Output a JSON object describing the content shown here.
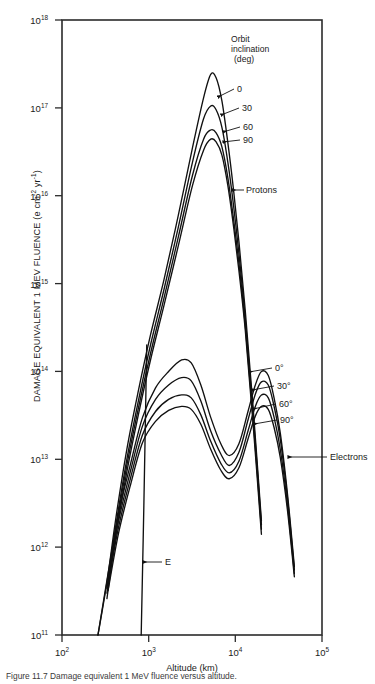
{
  "figure": {
    "caption": "Figure 11.7  Damage equivalent 1 MeV fluence versus altitude."
  },
  "axes": {
    "x": {
      "title": "Altitude (km)",
      "ticks": [
        {
          "mantissa": "10",
          "exp": "2",
          "value": 100
        },
        {
          "mantissa": "10",
          "exp": "3",
          "value": 1000
        },
        {
          "mantissa": "10",
          "exp": "4",
          "value": 10000
        },
        {
          "mantissa": "10",
          "exp": "5",
          "value": 100000
        }
      ]
    },
    "y": {
      "title_main": "DAMAGE EQUIVALENT 1 MEV FLUENCE (e cm",
      "title_sup1": "-2",
      "title_mid": " yr",
      "title_sup2": "-1",
      "title_end": ")",
      "ticks": [
        {
          "mantissa": "10",
          "exp": "18",
          "value": 1e+18
        },
        {
          "mantissa": "10",
          "exp": "17",
          "value": 1e+17
        },
        {
          "mantissa": "10",
          "exp": "16",
          "value": 1e+16
        },
        {
          "mantissa": "10",
          "exp": "15",
          "value": 1000000000000000.0
        },
        {
          "mantissa": "10",
          "exp": "14",
          "value": 100000000000000.0
        },
        {
          "mantissa": "10",
          "exp": "13",
          "value": 10000000000000.0
        },
        {
          "mantissa": "10",
          "exp": "12",
          "value": 1000000000000.0
        },
        {
          "mantissa": "10",
          "exp": "11",
          "value": 100000000000.0
        }
      ]
    }
  },
  "legend": {
    "line1": "Orbit",
    "line2": "inclination",
    "line3": "(deg)"
  },
  "annotations": {
    "protons": "Protons",
    "electrons": "Electrons",
    "e_marker": "E",
    "proton_labels": [
      "0",
      "30",
      "60",
      "90"
    ],
    "electron_labels": [
      "0°",
      "30°",
      "60°",
      "90°"
    ]
  },
  "chart_data": {
    "type": "line",
    "xlabel": "Altitude (km)",
    "ylabel": "DAMAGE EQUIVALENT 1 MEV FLUENCE (e cm^-2 yr^-1)",
    "xscale": "log",
    "yscale": "log",
    "xlim": [
      100,
      100000
    ],
    "ylim": [
      100000000000.0,
      1e+18
    ],
    "grid": false,
    "legend_position": "inside-upper-right",
    "legend_title": "Orbit inclination (deg)",
    "series": [
      {
        "name": "Protons 0 deg",
        "particle": "protons",
        "inclination_deg": 0,
        "x": [
          260,
          330,
          420,
          560,
          760,
          1050,
          1500,
          2200,
          3200,
          4300,
          5200,
          6000,
          7000,
          8200,
          9500,
          11000,
          13000,
          16000,
          20000
        ],
        "y": [
          100000000000.0,
          400000000000.0,
          2200000000000.0,
          13000000000000.0,
          60000000000000.0,
          260000000000000.0,
          1100000000000000.0,
          6000000000000000.0,
          3.5e+16,
          1.3e+17,
          2.4e+17,
          2.2e+17,
          1.2e+17,
          4e+16,
          1.2e+16,
          3000000000000000.0,
          500000000000000.0,
          40000000000000.0,
          2000000000000.0
        ]
      },
      {
        "name": "Protons 30 deg",
        "particle": "protons",
        "inclination_deg": 30,
        "x": [
          260,
          330,
          420,
          560,
          760,
          1050,
          1500,
          2200,
          3200,
          4300,
          5200,
          6000,
          7000,
          8200,
          9500,
          11000,
          13000,
          16000,
          20000
        ],
        "y": [
          90000000000.0,
          340000000000.0,
          1800000000000.0,
          10000000000000.0,
          46000000000000.0,
          200000000000000.0,
          850000000000000.0,
          4400000000000000.0,
          2.4e+16,
          7.5e+16,
          1.05e+17,
          9.5e+16,
          6e+16,
          2.4e+16,
          8000000000000000.0,
          2200000000000000.0,
          400000000000000.0,
          34000000000000.0,
          1800000000000.0
        ]
      },
      {
        "name": "Protons 60 deg",
        "particle": "protons",
        "inclination_deg": 60,
        "x": [
          260,
          330,
          420,
          560,
          760,
          1050,
          1500,
          2200,
          3200,
          4300,
          5200,
          6000,
          7000,
          8200,
          9500,
          11000,
          13000,
          16000,
          20000
        ],
        "y": [
          80000000000.0,
          300000000000.0,
          1600000000000.0,
          8500000000000.0,
          38000000000000.0,
          160000000000000.0,
          680000000000000.0,
          3400000000000000.0,
          1.7e+16,
          4.4e+16,
          5.6e+16,
          5.2e+16,
          3.6e+16,
          1.6e+16,
          5600000000000000.0,
          1700000000000000.0,
          340000000000000.0,
          30000000000000.0,
          1600000000000.0
        ]
      },
      {
        "name": "Protons 90 deg",
        "particle": "protons",
        "inclination_deg": 90,
        "x": [
          260,
          330,
          420,
          560,
          760,
          1050,
          1500,
          2200,
          3200,
          4300,
          5200,
          6000,
          7000,
          8200,
          9500,
          11000,
          13000,
          16000,
          20000
        ],
        "y": [
          70000000000.0,
          260000000000.0,
          1400000000000.0,
          7200000000000.0,
          32000000000000.0,
          135000000000000.0,
          560000000000000.0,
          2700000000000000.0,
          1.3e+16,
          3.3e+16,
          4.4e+16,
          4.1e+16,
          2.9e+16,
          1.3e+16,
          4600000000000000.0,
          1400000000000000.0,
          300000000000000.0,
          26000000000000.0,
          1400000000000.0
        ]
      },
      {
        "name": "Electrons 0 deg",
        "particle": "electrons",
        "inclination_deg": 0,
        "x": [
          260,
          340,
          450,
          620,
          850,
          1200,
          1700,
          2400,
          3100,
          4000,
          5200,
          6800,
          8500,
          11000,
          14000,
          17000,
          20000,
          24000,
          28000,
          33000,
          40000,
          48000
        ],
        "y": [
          100000000000.0,
          500000000000.0,
          2400000000000.0,
          9000000000000.0,
          30000000000000.0,
          65000000000000.0,
          100000000000000.0,
          135000000000000.0,
          125000000000000.0,
          70000000000000.0,
          30000000000000.0,
          15000000000000.0,
          11000000000000.0,
          15000000000000.0,
          35000000000000.0,
          70000000000000.0,
          100000000000000.0,
          90000000000000.0,
          50000000000000.0,
          20000000000000.0,
          4000000000000.0,
          600000000000.0
        ]
      },
      {
        "name": "Electrons 30 deg",
        "particle": "electrons",
        "inclination_deg": 30,
        "x": [
          260,
          340,
          450,
          620,
          850,
          1200,
          1700,
          2400,
          3100,
          4000,
          5200,
          6800,
          8500,
          11000,
          14000,
          17000,
          20000,
          24000,
          28000,
          33000,
          40000,
          48000
        ],
        "y": [
          90000000000.0,
          440000000000.0,
          2000000000000.0,
          7500000000000.0,
          24000000000000.0,
          48000000000000.0,
          70000000000000.0,
          85000000000000.0,
          78000000000000.0,
          46000000000000.0,
          21000000000000.0,
          11500000000000.0,
          8500000000000.0,
          12000000000000.0,
          28000000000000.0,
          55000000000000.0,
          76000000000000.0,
          70000000000000.0,
          40000000000000.0,
          17000000000000.0,
          3600000000000.0,
          550000000000.0
        ]
      },
      {
        "name": "Electrons 60 deg",
        "particle": "electrons",
        "inclination_deg": 60,
        "x": [
          260,
          340,
          450,
          620,
          850,
          1200,
          1700,
          2400,
          3100,
          4000,
          5200,
          6800,
          8500,
          11000,
          14000,
          17000,
          20000,
          24000,
          28000,
          33000,
          40000,
          48000
        ],
        "y": [
          80000000000.0,
          380000000000.0,
          1700000000000.0,
          6200000000000.0,
          19000000000000.0,
          35000000000000.0,
          48000000000000.0,
          54000000000000.0,
          50000000000000.0,
          32000000000000.0,
          16000000000000.0,
          9000000000000.0,
          7000000000000.0,
          9500000000000.0,
          21000000000000.0,
          40000000000000.0,
          54000000000000.0,
          50000000000000.0,
          30000000000000.0,
          13000000000000.0,
          3000000000000.0,
          500000000000.0
        ]
      },
      {
        "name": "Electrons 90 deg",
        "particle": "electrons",
        "inclination_deg": 90,
        "x": [
          260,
          340,
          450,
          620,
          850,
          1200,
          1700,
          2400,
          3100,
          4000,
          5200,
          6800,
          8500,
          11000,
          14000,
          17000,
          20000,
          24000,
          28000,
          33000,
          40000,
          48000
        ],
        "y": [
          70000000000.0,
          320000000000.0,
          1450000000000.0,
          5200000000000.0,
          15500000000000.0,
          27000000000000.0,
          36000000000000.0,
          40000000000000.0,
          37000000000000.0,
          25000000000000.0,
          13000000000000.0,
          7500000000000.0,
          6000000000000.0,
          8000000000000.0,
          17000000000000.0,
          31000000000000.0,
          40000000000000.0,
          37000000000000.0,
          23000000000000.0,
          10500000000000.0,
          2600000000000.0,
          460000000000.0
        ]
      },
      {
        "name": "E boundary marker",
        "particle": "marker",
        "x": [
          820,
          880,
          950
        ],
        "y": [
          100000000000.0,
          3000000000000.0,
          200000000000000.0
        ]
      }
    ],
    "annotations": [
      {
        "text": "Protons",
        "x": 14000,
        "y": 1e+16
      },
      {
        "text": "Electrons",
        "x": 60000,
        "y": 16000000000000.0
      },
      {
        "text": "E",
        "x": 1300,
        "y": 1600000000000.0
      }
    ]
  }
}
